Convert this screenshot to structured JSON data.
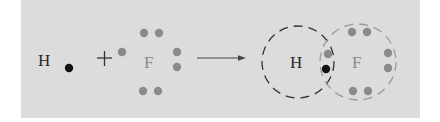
{
  "diagram": {
    "type": "lewis-dot-covalent-bond-formation",
    "colors": {
      "background": "#dcdcdc",
      "hydrogen_electron": "#111111",
      "fluorine_electron": "#8a8a8a",
      "hydrogen_symbol": "#2a2a2a",
      "fluorine_symbol": "#8a8a8a",
      "hydrogen_shell": "#333333",
      "fluorine_shell": "#9a9a9a"
    },
    "reactants": [
      {
        "symbol": "H",
        "valence_electrons": 1
      },
      {
        "symbol": "F",
        "valence_electrons": 7
      }
    ],
    "operator": "+",
    "arrow": "→",
    "product": {
      "atoms": [
        "H",
        "F"
      ],
      "shared_electrons": 2,
      "description": "Overlapping dashed electron shells around H and F sharing one electron pair"
    }
  }
}
